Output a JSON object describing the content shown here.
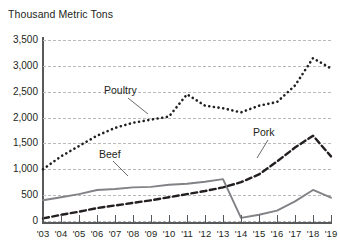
{
  "chart_data": {
    "type": "line",
    "title": "Thousand Metric Tons",
    "xlabel": "",
    "ylabel": "Thousand Metric Tons",
    "ylim": [
      0,
      3500
    ],
    "ytick_step": 500,
    "grid": true,
    "legend_position": "inline-annotations",
    "categories": [
      "'03",
      "'04",
      "'05",
      "'06",
      "'07",
      "'08",
      "'09",
      "'10",
      "'11",
      "'12",
      "'13",
      "'14",
      "'15",
      "'16",
      "'17",
      "'18",
      "'19"
    ],
    "ytick_labels": [
      "0",
      "500",
      "1,000",
      "1,500",
      "2,000",
      "2,500",
      "3,000",
      "3,500"
    ],
    "ytick_values": [
      0,
      500,
      1000,
      1500,
      2000,
      2500,
      3000,
      3500
    ],
    "series": [
      {
        "name": "Poultry",
        "style": "dotted",
        "color": "#231f20",
        "values": [
          1000,
          1250,
          1450,
          1650,
          1800,
          1900,
          1960,
          2020,
          2450,
          2230,
          2180,
          2100,
          2230,
          2300,
          2620,
          3150,
          2950
        ]
      },
      {
        "name": "Beef",
        "style": "solid",
        "color": "#808285",
        "values": [
          400,
          460,
          520,
          600,
          620,
          650,
          660,
          700,
          720,
          760,
          810,
          60,
          120,
          200,
          380,
          600,
          450
        ]
      },
      {
        "name": "Pork",
        "style": "dashed",
        "color": "#231f20",
        "values": [
          50,
          120,
          180,
          250,
          300,
          350,
          400,
          460,
          520,
          580,
          650,
          750,
          900,
          1150,
          1420,
          1650,
          1250
        ]
      }
    ]
  },
  "annotations": {
    "poultry_label": "Poultry",
    "beef_label": "Beef",
    "pork_label": "Pork"
  },
  "axis": {
    "y_title": "Thousand Metric Tons"
  }
}
